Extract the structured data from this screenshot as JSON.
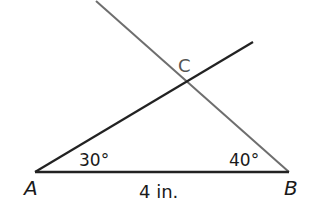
{
  "diagram": {
    "type": "triangle-construction",
    "colors": {
      "line_dark": "#222222",
      "line_gray": "#6e6e6e",
      "text": "#1a1a1a",
      "label_c": "#555555",
      "background": "#ffffff"
    },
    "points": {
      "A": {
        "label": "A",
        "x": 35,
        "y": 172
      },
      "B": {
        "label": "B",
        "x": 289,
        "y": 172
      },
      "C": {
        "label": "C",
        "x": 186,
        "y": 82
      }
    },
    "segments": [
      {
        "name": "AB",
        "from": [
          35,
          172
        ],
        "to": [
          289,
          172
        ],
        "color": "#222222"
      },
      {
        "name": "AC-ray",
        "from": [
          35,
          172
        ],
        "to": [
          253,
          42
        ],
        "color": "#222222"
      },
      {
        "name": "BC-ray",
        "from": [
          289,
          172
        ],
        "to": [
          96,
          1
        ],
        "color": "#6e6e6e"
      }
    ],
    "angles": {
      "A": "30°",
      "B": "40°"
    },
    "side_length": {
      "AB": "4 in."
    }
  }
}
